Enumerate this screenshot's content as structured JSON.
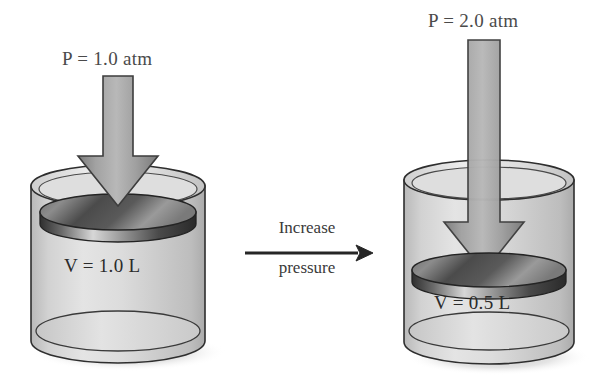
{
  "figure": {
    "background_color": "#ffffff"
  },
  "left_system": {
    "pressure_label": "P = 1.0 atm",
    "pressure_symbol": "P",
    "pressure_value": "1.0",
    "pressure_unit": "atm",
    "volume_label": "V = 1.0 L",
    "volume_symbol": "V",
    "volume_value": "1.0",
    "volume_unit": "L",
    "arrow_icon": "down-arrow-wide-icon",
    "cylinder_icon": "cylinder-icon",
    "piston_icon": "piston-disk-icon"
  },
  "transition": {
    "line1": "Increase",
    "line2": "pressure",
    "arrow_icon": "right-arrow-icon"
  },
  "right_system": {
    "pressure_label": "P = 2.0 atm",
    "pressure_symbol": "P",
    "pressure_value": "2.0",
    "pressure_unit": "atm",
    "volume_label": "V = 0.5 L",
    "volume_symbol": "V",
    "volume_value": "0.5",
    "volume_unit": "L",
    "arrow_icon": "down-arrow-narrow-long-icon",
    "cylinder_icon": "cylinder-icon",
    "piston_icon": "piston-disk-icon"
  },
  "colors": {
    "arrow_fill": "#8a8a8a",
    "arrow_stroke": "#3d3d3d",
    "glass_fill": "#d8d8d8",
    "glass_stroke": "#2e2e2e",
    "piston_dark": "#3a3a3a",
    "piston_light": "#cfcfcf",
    "shadow": "#c9c9c9",
    "text_gray": "#4a4a4a",
    "text_dark": "#2b2b2b"
  }
}
